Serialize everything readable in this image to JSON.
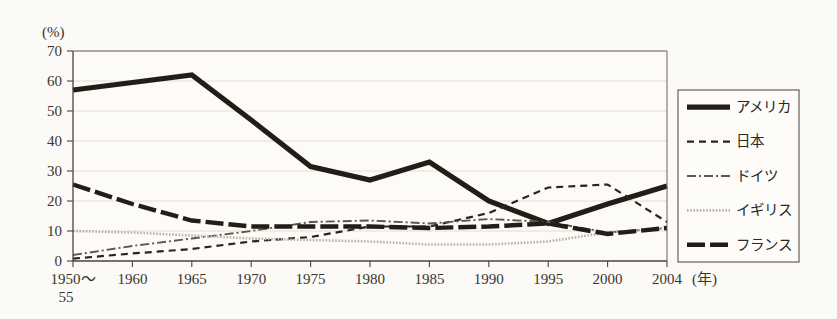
{
  "chart_data": {
    "type": "line",
    "title": "",
    "xlabel": "(年)",
    "ylabel": "(%)",
    "ylim": [
      0,
      70
    ],
    "yticks": [
      0,
      10,
      20,
      30,
      40,
      50,
      60,
      70
    ],
    "grid": true,
    "legend_position": "right-outside",
    "categories": [
      "1950～\n55",
      "1960",
      "1965",
      "1970",
      "1975",
      "1980",
      "1985",
      "1990",
      "1995",
      "2000",
      "2004"
    ],
    "x_tick_labels": [
      "1950～",
      "1960",
      "1965",
      "1970",
      "1975",
      "1980",
      "1985",
      "1990",
      "1995",
      "2000",
      "2004"
    ],
    "x_tick_sublabel": "55",
    "series": [
      {
        "name": "アメリカ",
        "style": "solid-thick",
        "color": "#231d16",
        "width": 5.2,
        "dash": "none",
        "values": [
          57,
          59.5,
          62,
          47,
          31.5,
          27,
          33,
          20,
          12.5,
          19,
          25
        ]
      },
      {
        "name": "日本",
        "style": "dashed",
        "color": "#2a241c",
        "width": 2.2,
        "dash": "7,5",
        "values": [
          0.8,
          2.5,
          4,
          6.5,
          8,
          11.5,
          11.5,
          16,
          24.5,
          25.5,
          13
        ]
      },
      {
        "name": "ドイツ",
        "style": "dash-dot",
        "color": "#5d574c",
        "width": 1.9,
        "dash": "9,3,2,3",
        "values": [
          2,
          5,
          7.5,
          10,
          13,
          13.5,
          12.5,
          14,
          13,
          9.5,
          11
        ]
      },
      {
        "name": "イギリス",
        "style": "dotted",
        "color": "#b9b3a4",
        "width": 2.6,
        "dash": "1.6,1.6",
        "values": [
          10,
          9.5,
          8.5,
          7.5,
          7,
          6.5,
          5.5,
          5.5,
          6.5,
          9.5,
          11
        ]
      },
      {
        "name": "フランス",
        "style": "long-dash-thick",
        "color": "#221d17",
        "width": 4.4,
        "dash": "18,5",
        "values": [
          25.5,
          19,
          13.5,
          11.5,
          11.5,
          11.5,
          11,
          11.5,
          12.5,
          9,
          11
        ]
      }
    ]
  },
  "legend": {
    "items": [
      {
        "label": "アメリカ"
      },
      {
        "label": "日本"
      },
      {
        "label": "ドイツ"
      },
      {
        "label": "イギリス"
      },
      {
        "label": "フランス"
      }
    ]
  },
  "axes": {
    "y_unit_label": "(%)",
    "x_unit_label": "(年)"
  }
}
